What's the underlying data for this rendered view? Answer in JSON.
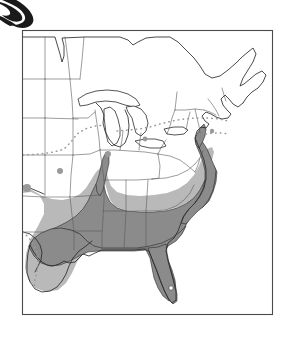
{
  "figure": {
    "kind": "species-distribution-map",
    "region": "Eastern United States",
    "background_color": "#ffffff",
    "frame": {
      "x": 22,
      "y": 30,
      "width": 251,
      "height": 285,
      "stroke_color": "#4a4a4a",
      "fill_color": "#ffffff"
    },
    "colors": {
      "outline_dark": "#2b2b2b",
      "state_border": "#5a5a5a",
      "range_outer_fill": "#b9b9b9",
      "range_core_fill": "#8b8b8b",
      "range_core_outline": "#1e1e1e",
      "dotted_line": "#9a9a9a",
      "occurrence_dot": "#9a9a9a",
      "logo_fill": "#1a1a1a",
      "lake_fill": "#ffffff"
    }
  },
  "legend_shading": [
    {
      "name": "range-outer",
      "label": "Outer / peripheral range",
      "fill": "#b9b9b9"
    },
    {
      "name": "range-core",
      "label": "Core breeding range",
      "fill": "#8b8b8b"
    }
  ],
  "map_layers": {
    "coastline_outline": "black line work for Atlantic and Gulf coasts, Great Lakes, Canadian border",
    "state_boundaries": "thin gray interior state division lines",
    "dotted_boundaries": "gray dotted isopleth / limit-of-occurrence lines across the upper Midwest, Northeast and south Texas",
    "isolated_dots": "small gray filled circles marking scattered outlying records"
  },
  "occurrence_dots": [
    {
      "cx": 27,
      "cy": 188,
      "r": 4.0
    },
    {
      "cx": 60,
      "cy": 171,
      "r": 3.0
    },
    {
      "cx": 108,
      "cy": 154,
      "r": 3.0
    },
    {
      "cx": 145,
      "cy": 139,
      "r": 2.4
    },
    {
      "cx": 212,
      "cy": 131,
      "r": 2.2
    }
  ],
  "decoration": {
    "top_left_crescent": {
      "name": "cropped-illustration-crescent",
      "description": "dark crescent / wing shape cropped by the top-left image edge",
      "fill": "#1a1a1a"
    }
  }
}
